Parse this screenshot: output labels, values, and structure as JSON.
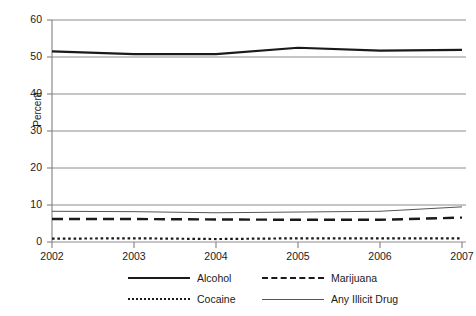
{
  "chart_data": {
    "type": "line",
    "title": "",
    "xlabel": "",
    "ylabel": "Percent",
    "x": [
      2002,
      2003,
      2004,
      2005,
      2006,
      2007
    ],
    "xtick_labels": [
      "2002",
      "2003",
      "2004",
      "2005",
      "2006",
      "2007"
    ],
    "ytick_labels": [
      "0",
      "10",
      "20",
      "30",
      "40",
      "50",
      "60"
    ],
    "yticks": [
      0,
      10,
      20,
      30,
      40,
      50,
      60
    ],
    "ylim": [
      0,
      60
    ],
    "xlim": [
      2002,
      2007
    ],
    "grid": "horizontal",
    "legend_position": "bottom",
    "series": [
      {
        "name": "Alcohol",
        "style": "solid-thick",
        "color": "#1a1a1a",
        "values": [
          51.5,
          50.8,
          50.8,
          52.5,
          51.7,
          51.9
        ]
      },
      {
        "name": "Marijuana",
        "style": "dashed",
        "color": "#1a1a1a",
        "values": [
          6.2,
          6.2,
          6.1,
          6.0,
          6.0,
          6.6
        ]
      },
      {
        "name": "Cocaine",
        "style": "dotted",
        "color": "#1a1a1a",
        "values": [
          0.9,
          1.0,
          0.8,
          1.0,
          1.0,
          1.0
        ]
      },
      {
        "name": "Any Illicit Drug",
        "style": "solid-thin",
        "color": "#555555",
        "values": [
          8.3,
          8.2,
          7.9,
          8.1,
          8.3,
          9.5
        ]
      }
    ]
  },
  "axis": {
    "y_title": "Percent"
  },
  "legend": {
    "items": [
      {
        "label": "Alcohol",
        "style": "solid-thick"
      },
      {
        "label": "Marijuana",
        "style": "dashed"
      },
      {
        "label": "Cocaine",
        "style": "dotted"
      },
      {
        "label": "Any Illicit Drug",
        "style": "solid-thin"
      }
    ]
  },
  "colors": {
    "ink": "#1a1a1a",
    "grid": "#808080",
    "thin_series": "#555555",
    "background": "#ffffff"
  }
}
